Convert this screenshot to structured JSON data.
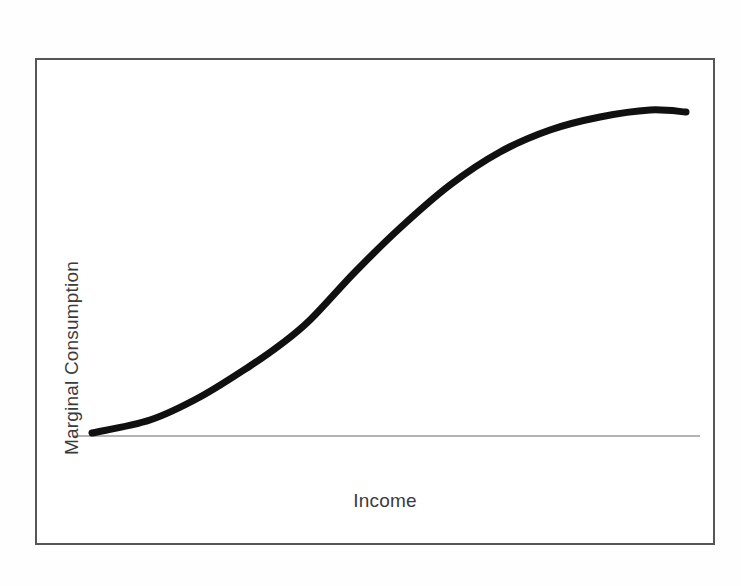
{
  "figure": {
    "background_color": "#fefefe",
    "frame_color": "#565656",
    "frame": {
      "x": 35,
      "y": 58,
      "width": 680,
      "height": 487
    }
  },
  "chart_data": {
    "type": "line",
    "title": "",
    "subtitle": "",
    "xlabel": "Income",
    "ylabel": "Marginal Consumption",
    "grid": false,
    "legend": null,
    "legend_position": "none",
    "xticks": [],
    "yticks": [],
    "xticklabels": [],
    "yticklabels": [],
    "xlim": [
      0,
      1
    ],
    "ylim": [
      0,
      1
    ],
    "annotations": [],
    "series": [
      {
        "name": "Marginal consumption curve",
        "color": "#101010",
        "line_width": 7,
        "style": "solid",
        "x": [
          0.0,
          0.1,
          0.18,
          0.26,
          0.31,
          0.36,
          0.43,
          0.51,
          0.59,
          0.67,
          0.75,
          0.84,
          0.92,
          1.0
        ],
        "y": [
          0.005,
          0.045,
          0.115,
          0.21,
          0.275,
          0.35,
          0.495,
          0.63,
          0.76,
          0.862,
          0.93,
          0.97,
          0.992,
          0.985
        ]
      }
    ],
    "baseline": {
      "name": "zero-baseline",
      "color": "#9a9a9a",
      "line_width": 1,
      "y_value": 0.0,
      "x_start": 0.0,
      "x_end": 1.0
    },
    "pixel_geometry": {
      "curve_points": [
        [
          92,
          433
        ],
        [
          150,
          420
        ],
        [
          200,
          397
        ],
        [
          250,
          366
        ],
        [
          280,
          345
        ],
        [
          310,
          320
        ],
        [
          355,
          272
        ],
        [
          400,
          228
        ],
        [
          450,
          185
        ],
        [
          500,
          152
        ],
        [
          550,
          130
        ],
        [
          600,
          117
        ],
        [
          650,
          110
        ],
        [
          686,
          112
        ]
      ],
      "baseline_y": 436,
      "baseline_x_start": 74,
      "baseline_x_end": 700
    }
  }
}
